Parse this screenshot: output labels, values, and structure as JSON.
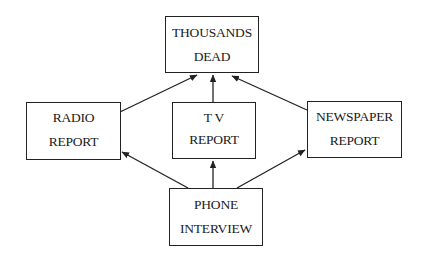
{
  "diagram": {
    "type": "flow",
    "nodes": [
      {
        "id": "dead",
        "lines": [
          "THOUSANDS",
          "DEAD"
        ]
      },
      {
        "id": "radio",
        "lines": [
          "RADIO",
          "REPORT"
        ]
      },
      {
        "id": "tv",
        "lines": [
          "T V",
          "REPORT"
        ]
      },
      {
        "id": "news",
        "lines": [
          "NEWSPAPER",
          "REPORT"
        ]
      },
      {
        "id": "phone",
        "lines": [
          "PHONE",
          "INTERVIEW"
        ]
      }
    ],
    "edges": [
      {
        "from": "radio",
        "to": "dead"
      },
      {
        "from": "tv",
        "to": "dead"
      },
      {
        "from": "news",
        "to": "dead"
      },
      {
        "from": "phone",
        "to": "radio"
      },
      {
        "from": "phone",
        "to": "tv"
      },
      {
        "from": "phone",
        "to": "news"
      }
    ],
    "colors": {
      "line": "#222222",
      "background": "#ffffff"
    }
  }
}
